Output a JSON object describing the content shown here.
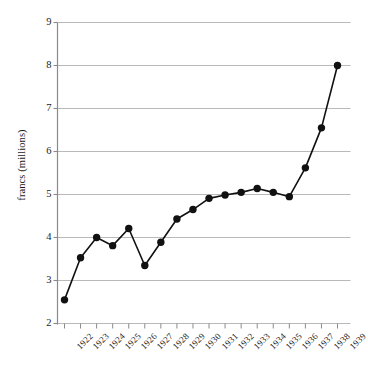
{
  "chart_data": {
    "type": "line",
    "title": "",
    "subtitle": "",
    "xlabel": "",
    "ylabel": "francs (millions)",
    "categories": [
      "1922",
      "1923",
      "1924",
      "1925",
      "1926",
      "1927",
      "1928",
      "1929",
      "1930",
      "1931",
      "1932",
      "1933",
      "1934",
      "1935",
      "1936",
      "1937",
      "1938",
      "1939"
    ],
    "values": [
      2.55,
      3.53,
      4.0,
      3.81,
      4.21,
      3.35,
      3.89,
      4.43,
      4.65,
      4.91,
      4.99,
      5.05,
      5.14,
      5.05,
      4.95,
      5.62,
      6.55,
      8.0
    ],
    "series": [
      {
        "name": "francs (millions)",
        "values": [
          2.55,
          3.53,
          4.0,
          3.81,
          4.21,
          3.35,
          3.89,
          4.43,
          4.65,
          4.91,
          4.99,
          5.05,
          5.14,
          5.05,
          4.95,
          5.62,
          6.55,
          8.0
        ]
      }
    ],
    "ylim": [
      2,
      9
    ],
    "yticks": [
      2,
      3,
      4,
      5,
      6,
      7,
      8,
      9
    ],
    "ytick_labels": [
      "2",
      "3",
      "4",
      "5",
      "6",
      "7",
      "8",
      "9"
    ],
    "xtick_labels": [
      "1922",
      "1923",
      "1924",
      "1925",
      "1926",
      "1927",
      "1928",
      "1929",
      "1930",
      "1931",
      "1932",
      "1933",
      "1934",
      "1935",
      "1936",
      "1937",
      "1938",
      "1939"
    ],
    "grid": "horizontal",
    "legend": "none",
    "marker": "filled-circle",
    "colors": {
      "line": "#111111",
      "marker": "#111111",
      "grid": "#b9b9b9",
      "axis": "#8a8a8a",
      "text": "#1d1d1d",
      "background": "#ffffff"
    },
    "annotations": []
  }
}
